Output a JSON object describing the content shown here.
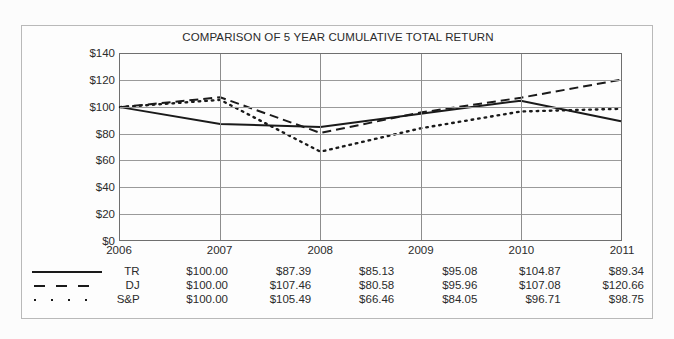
{
  "chart_data": {
    "type": "line",
    "title": "COMPARISON OF 5 YEAR CUMULATIVE TOTAL RETURN",
    "xlabel": "",
    "ylabel": "",
    "categories": [
      "2006",
      "2007",
      "2008",
      "2009",
      "2010",
      "2011"
    ],
    "ylim": [
      0,
      140
    ],
    "yticks": [
      "$0",
      "$20",
      "$40",
      "$60",
      "$80",
      "$100",
      "$120",
      "$140"
    ],
    "ytick_values": [
      0,
      20,
      40,
      60,
      80,
      100,
      120,
      140
    ],
    "grid": true,
    "legend_position": "below-table-left",
    "series": [
      {
        "name": "TR",
        "style": "solid",
        "marker": "line-solid",
        "values": [
          100.0,
          87.39,
          85.13,
          95.08,
          104.87,
          89.34
        ],
        "labels": [
          "$100.00",
          "$87.39",
          "$85.13",
          "$95.08",
          "$104.87",
          "$89.34"
        ]
      },
      {
        "name": "DJ",
        "style": "dashed",
        "marker": "line-dashed",
        "values": [
          100.0,
          107.46,
          80.58,
          95.96,
          107.08,
          120.66
        ],
        "labels": [
          "$100.00",
          "$107.46",
          "$80.58",
          "$95.96",
          "$107.08",
          "$120.66"
        ]
      },
      {
        "name": "S&P",
        "style": "dotted",
        "marker": "line-dotted",
        "values": [
          100.0,
          105.49,
          66.46,
          84.05,
          96.71,
          98.75
        ],
        "labels": [
          "$100.00",
          "$105.49",
          "$66.46",
          "$84.05",
          "$96.71",
          "$98.75"
        ]
      }
    ],
    "colors": {
      "line": "#1a1a1a",
      "grid": "#9a9a9a",
      "axis": "#6f6f6f",
      "text": "#2b2b2b",
      "background": "#fdfdfd",
      "border": "#b9b9b9"
    }
  }
}
